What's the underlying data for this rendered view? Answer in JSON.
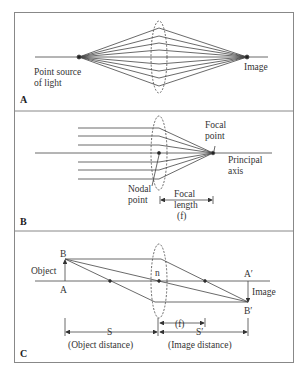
{
  "panels": [
    {
      "id": "A",
      "label": "A",
      "title": "Convergence of light from a point source",
      "labels": {
        "source_line1": "Point source",
        "source_line2": "of light",
        "image": "Image"
      }
    },
    {
      "id": "B",
      "label": "B",
      "title": "Parallel rays focused at focal point",
      "labels": {
        "focal_line1": "Focal",
        "focal_line2": "point",
        "axis_line1": "Principal",
        "axis_line2": "axis",
        "nodal_line1": "Nodal",
        "nodal_line2": "point",
        "fl_line1": "Focal",
        "fl_line2": "length",
        "fl_line3": "(f)"
      }
    },
    {
      "id": "C",
      "label": "C",
      "title": "Object and image distances",
      "labels": {
        "B": "B",
        "A": "A",
        "object": "Object",
        "n": "n",
        "A_prime": "A′",
        "B_prime": "B′",
        "image": "Image",
        "f": "(f)",
        "S": "S",
        "S_prime": "S′",
        "object_distance": "(Object distance)",
        "image_distance": "(Image distance)"
      }
    }
  ],
  "colors": {
    "line": "#444444",
    "frame": "#888888",
    "background": "#ffffff"
  }
}
